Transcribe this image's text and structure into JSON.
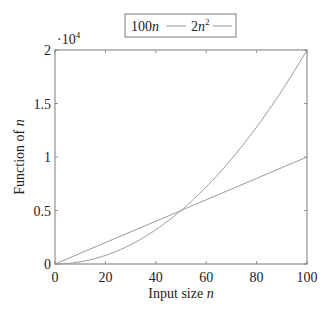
{
  "chart_data": {
    "type": "line",
    "title": "",
    "xlabel": "Input size n",
    "xlabel_plain": "Input size ",
    "xlabel_var": "n",
    "ylabel": "Function of n",
    "ylabel_plain": "Function of ",
    "ylabel_var": "n",
    "xlim": [
      0,
      100
    ],
    "ylim": [
      0,
      20000
    ],
    "y_scale_note": "·10^4",
    "y_scale_prefix": "·10",
    "y_scale_exp": "4",
    "x_ticks": [
      0,
      20,
      40,
      60,
      80,
      100
    ],
    "x_tick_labels": [
      "0",
      "20",
      "40",
      "60",
      "80",
      "100"
    ],
    "y_ticks": [
      0,
      5000,
      10000,
      15000,
      20000
    ],
    "y_tick_labels": [
      "0",
      "0.5",
      "1",
      "1.5",
      "2"
    ],
    "grid": false,
    "legend_position": "top-center, outside plot",
    "series": [
      {
        "name": "100n",
        "label_base": "100",
        "label_var": "n",
        "label_exp": "",
        "formula": "100*n",
        "color": "#9a9a9a",
        "style": "solid",
        "x": [
          0,
          10,
          20,
          30,
          40,
          50,
          60,
          70,
          80,
          90,
          100
        ],
        "values": [
          0,
          1000,
          2000,
          3000,
          4000,
          5000,
          6000,
          7000,
          8000,
          9000,
          10000
        ]
      },
      {
        "name": "2n^2",
        "label_base": "2",
        "label_var": "n",
        "label_exp": "2",
        "formula": "2*n^2",
        "color": "#9a9a9a",
        "style": "solid",
        "x": [
          0,
          10,
          20,
          30,
          40,
          50,
          60,
          70,
          80,
          90,
          100
        ],
        "values": [
          0,
          200,
          800,
          1800,
          3200,
          5000,
          7200,
          9800,
          12800,
          16200,
          20000
        ]
      }
    ]
  },
  "colors": {
    "axis": "#7a7a7a",
    "line": "#9a9a9a",
    "text": "#222222",
    "background": "#ffffff"
  }
}
